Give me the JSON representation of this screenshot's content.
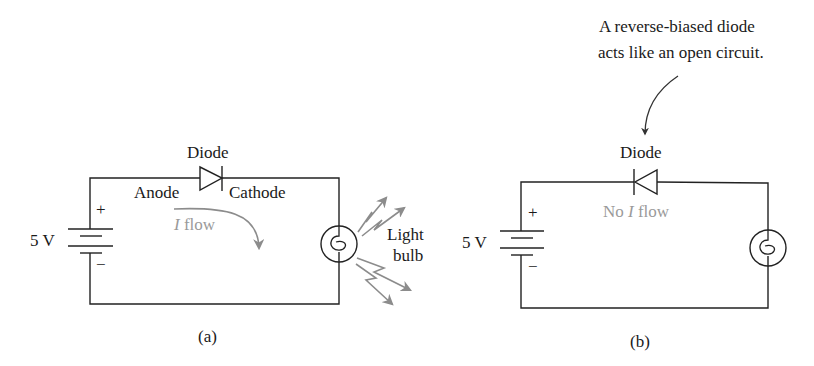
{
  "annotation": {
    "line1": "A reverse-biased diode",
    "line2": "acts like an open circuit."
  },
  "circuit_a": {
    "caption": "(a)",
    "battery_label": "5 V",
    "plus": "+",
    "minus": "−",
    "diode_label": "Diode",
    "anode_label": "Anode",
    "cathode_label": "Cathode",
    "current_label_italic": "I",
    "current_label_rest": " flow",
    "bulb_label_line1": "Light",
    "bulb_label_line2": "bulb"
  },
  "circuit_b": {
    "caption": "(b)",
    "battery_label": "5 V",
    "plus": "+",
    "minus": "−",
    "diode_label": "Diode",
    "current_label_prefix": "No ",
    "current_label_italic": "I",
    "current_label_rest": " flow"
  },
  "colors": {
    "ink": "#1a1a1a",
    "annotation_gray": "#9a9a9a",
    "arrow_gray": "#8c8c8c"
  }
}
